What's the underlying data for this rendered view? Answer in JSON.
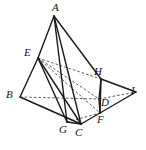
{
  "figure": {
    "kind": "solid-geometry-diagram",
    "background_color": "#ffffff",
    "stroke_color": "#1a1a1a",
    "hidden_stroke_color": "#4a4a4a",
    "width": 146,
    "height": 150,
    "vertices": [
      {
        "id": "A",
        "label": "A",
        "x": 54,
        "y": 16,
        "label_x": 52,
        "label_y": 2
      },
      {
        "id": "E",
        "label": "E",
        "x": 38,
        "y": 58,
        "label_x": 24,
        "label_y": 47
      },
      {
        "id": "B",
        "label": "B",
        "x": 20,
        "y": 97,
        "label_x": 6,
        "label_y": 89
      },
      {
        "id": "G",
        "label": "G",
        "x": 67,
        "y": 122,
        "label_x": 59,
        "label_y": 124
      },
      {
        "id": "C",
        "label": "C",
        "x": 81,
        "y": 124,
        "label_x": 75,
        "label_y": 127
      },
      {
        "id": "F",
        "label": "F",
        "x": 100,
        "y": 113,
        "label_x": 97,
        "label_y": 114
      },
      {
        "id": "D",
        "label": "D",
        "x": 99,
        "y": 99,
        "label_x": 101,
        "label_y": 97
      },
      {
        "id": "H",
        "label": "H",
        "x": 101,
        "y": 79,
        "label_x": 94,
        "label_y": 66
      },
      {
        "id": "I",
        "label": "I",
        "x": 136,
        "y": 92,
        "label_x": 131,
        "label_y": 85
      }
    ],
    "solid_edges": [
      {
        "name": "A-E",
        "from": "A",
        "to": "E"
      },
      {
        "name": "A-G",
        "from": "A",
        "to": "G"
      },
      {
        "name": "A-C",
        "from": "A",
        "to": "C"
      },
      {
        "name": "A-H",
        "from": "A",
        "to": "H"
      },
      {
        "name": "E-B",
        "from": "E",
        "to": "B"
      },
      {
        "name": "E-G",
        "from": "E",
        "to": "G"
      },
      {
        "name": "E-C",
        "from": "E",
        "to": "C"
      },
      {
        "name": "B-C",
        "from": "B",
        "to": "C"
      },
      {
        "name": "G-C",
        "from": "G",
        "to": "C"
      },
      {
        "name": "C-F",
        "from": "C",
        "to": "F"
      },
      {
        "name": "H-F",
        "from": "H",
        "to": "F"
      },
      {
        "name": "H-D",
        "from": "H",
        "to": "D"
      },
      {
        "name": "D-F",
        "from": "D",
        "to": "F"
      },
      {
        "name": "H-I",
        "from": "H",
        "to": "I"
      },
      {
        "name": "F-I",
        "from": "F",
        "to": "I"
      }
    ],
    "dashed_edges": [
      {
        "name": "B-D-hidden",
        "from": "B",
        "to": "D"
      },
      {
        "name": "D-I-hidden",
        "from": "D",
        "to": "I"
      },
      {
        "name": "E-H-hidden",
        "from": "E",
        "to": "H"
      },
      {
        "name": "E-D-hidden",
        "from": "E",
        "to": "D"
      },
      {
        "name": "E-F-hidden",
        "from": "E",
        "to": "F"
      },
      {
        "name": "G-F-hidden",
        "from": "G",
        "to": "F"
      }
    ]
  }
}
